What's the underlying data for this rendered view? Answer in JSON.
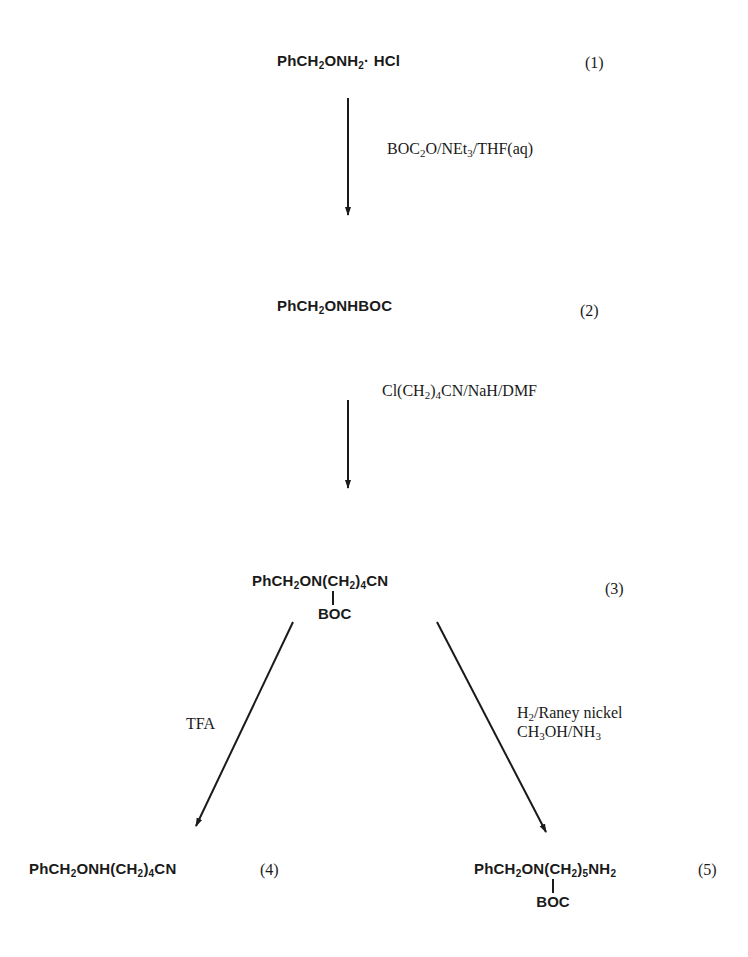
{
  "scheme": {
    "compounds": [
      {
        "id": "1",
        "label": "(1)",
        "formula_parts": [
          "PhCH",
          "2",
          "ONH",
          "2",
          "· HCl"
        ]
      },
      {
        "id": "2",
        "label": "(2)",
        "formula_parts": [
          "PhCH",
          "2",
          "ONHBOC"
        ]
      },
      {
        "id": "3",
        "label": "(3)",
        "formula_parts": [
          "PhCH",
          "2",
          "ON(CH",
          "2",
          ")",
          "4",
          "CN"
        ],
        "substituent": "BOC"
      },
      {
        "id": "4",
        "label": "(4)",
        "formula_parts": [
          "PhCH",
          "2",
          "ONH(CH",
          "2",
          ")",
          "4",
          "CN"
        ]
      },
      {
        "id": "5",
        "label": "(5)",
        "formula_parts": [
          "PhCH",
          "2",
          "ON(CH",
          "2",
          ")",
          "5",
          "NH",
          "2"
        ],
        "substituent": "BOC"
      }
    ],
    "reagents": [
      {
        "step": "1-2",
        "parts": [
          "BOC",
          "2",
          "O/NEt",
          "3",
          "/THF(aq)"
        ]
      },
      {
        "step": "2-3",
        "parts": [
          "Cl(CH",
          "2",
          ")",
          "4",
          "CN/NaH/DMF"
        ]
      },
      {
        "step": "3-4",
        "parts": [
          "TFA"
        ]
      },
      {
        "step": "3-5",
        "line1": [
          "H",
          "2",
          "/Raney nickel"
        ],
        "line2": [
          "CH",
          "3",
          "OH/NH",
          "3"
        ]
      }
    ]
  }
}
